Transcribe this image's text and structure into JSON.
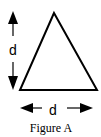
{
  "figure": {
    "caption": "Figure A",
    "shape": "equilateral-triangle",
    "height_label": "d",
    "base_label": "d",
    "stroke_color": "#000000",
    "background": "#ffffff"
  }
}
